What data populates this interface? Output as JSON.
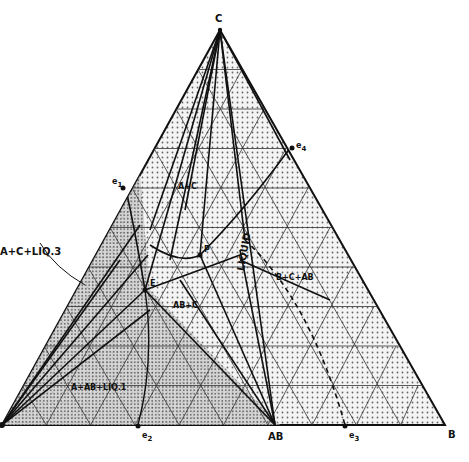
{
  "diagram": {
    "type": "ternary_phase_diagram",
    "vertices": {
      "top": "C",
      "bottom_left": "A",
      "bottom_right": "B",
      "compound_on_base": "AB"
    },
    "eutectic_points": {
      "e1": "e",
      "e1_sub": "1",
      "e2": "e",
      "e2_sub": "2",
      "e3": "e",
      "e3_sub": "3",
      "e4": "e",
      "e4_sub": "4"
    },
    "invariant_points": [
      "P",
      "E"
    ],
    "field_labels": {
      "a_plus_c": "A+C",
      "liquid": "LIQUID",
      "ab_plus_c": "AB+C",
      "b_plus_c_plus_ab": "B+C+AB",
      "a_plus_c_plus_liq3": "A+C+LIQ.3",
      "a_plus_ab_plus_liq1": "A+AB+LIQ.1",
      "ab_plus_c_vertical": "AB+C"
    },
    "colors": {
      "ink": "#1a1a1a",
      "fill_shade": "#d9d9d9",
      "background": "#ffffff"
    }
  }
}
